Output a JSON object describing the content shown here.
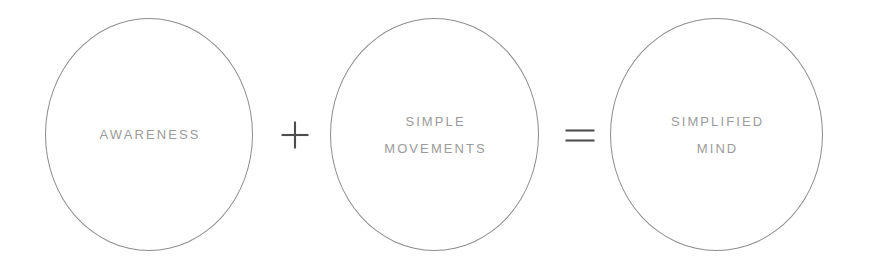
{
  "diagram": {
    "type": "equation-diagram",
    "background_color": "#ffffff",
    "stroke_color": "#8d8d8d",
    "text_color": "#9b9b9b",
    "operator_color": "#4e4e4e",
    "nodes": [
      {
        "id": "awareness",
        "lines": [
          "AWARENESS"
        ]
      },
      {
        "id": "simple-movements",
        "lines": [
          "SIMPLE",
          "MOVEMENTS"
        ]
      },
      {
        "id": "simplified-mind",
        "lines": [
          "SIMPLIFIED",
          "MIND"
        ]
      }
    ],
    "operators": [
      {
        "id": "plus",
        "symbol": "+"
      },
      {
        "id": "equals",
        "symbol": "="
      }
    ]
  }
}
